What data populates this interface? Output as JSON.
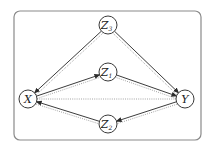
{
  "diagram": {
    "title": "",
    "nodes": [
      {
        "id": "Z3",
        "label": "Z",
        "subscript": "3"
      },
      {
        "id": "Z1",
        "label": "Z",
        "subscript": "1"
      },
      {
        "id": "X",
        "label": "X",
        "subscript": ""
      },
      {
        "id": "Y",
        "label": "Y",
        "subscript": ""
      },
      {
        "id": "Z2",
        "label": "Z",
        "subscript": "2"
      }
    ],
    "directed_edges": [
      {
        "from": "Z3",
        "to": "X"
      },
      {
        "from": "Z3",
        "to": "Y"
      },
      {
        "from": "X",
        "to": "Z1"
      },
      {
        "from": "Z1",
        "to": "Y"
      },
      {
        "from": "Y",
        "to": "Z2"
      },
      {
        "from": "Z2",
        "to": "X"
      }
    ],
    "dotted_edges": [
      {
        "from": "X",
        "to": "Z3"
      },
      {
        "from": "Y",
        "to": "Z3"
      },
      {
        "from": "X",
        "to": "Z1"
      },
      {
        "from": "Y",
        "to": "Z1"
      },
      {
        "from": "X",
        "to": "Y"
      },
      {
        "from": "X",
        "to": "Z2"
      },
      {
        "from": "Y",
        "to": "Z2"
      }
    ],
    "colors": {
      "solid_edge": "#3c3c3c",
      "dotted_edge": "#9a9a9a",
      "frame": "#8a8a8a"
    }
  }
}
